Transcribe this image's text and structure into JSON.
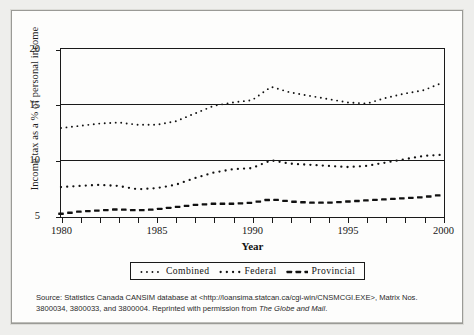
{
  "chart_data": {
    "type": "line",
    "title": "",
    "xlabel": "Year",
    "ylabel": "Income tax as a % of personal income",
    "xlim": [
      1980,
      2000
    ],
    "ylim": [
      5,
      20
    ],
    "yticks": [
      5,
      10,
      15,
      20
    ],
    "xticks": [
      1980,
      1981,
      1982,
      1983,
      1984,
      1985,
      1986,
      1987,
      1988,
      1989,
      1990,
      1991,
      1992,
      1993,
      1994,
      1995,
      1996,
      1997,
      1998,
      1999,
      2000
    ],
    "xtick_labels_shown": [
      1980,
      1985,
      1990,
      1995,
      2000
    ],
    "grid": "horizontal-gridlines-at-10-and-15",
    "legend_position": "below-axes-center",
    "x": [
      1980,
      1981,
      1982,
      1983,
      1984,
      1985,
      1986,
      1987,
      1988,
      1989,
      1990,
      1991,
      1992,
      1993,
      1994,
      1995,
      1996,
      1997,
      1998,
      1999,
      2000
    ],
    "series": [
      {
        "name": "Combined",
        "marker": "fine-dotted",
        "color": "#111111",
        "values": [
          12.9,
          13.1,
          13.3,
          13.4,
          13.2,
          13.2,
          13.5,
          14.2,
          14.9,
          15.2,
          15.4,
          16.6,
          16.1,
          15.8,
          15.5,
          15.2,
          15.1,
          15.6,
          16.0,
          16.3,
          17.0
        ]
      },
      {
        "name": "Federal",
        "marker": "medium-dotted",
        "color": "#111111",
        "values": [
          7.6,
          7.7,
          7.8,
          7.7,
          7.4,
          7.5,
          7.8,
          8.4,
          8.9,
          9.2,
          9.3,
          10.0,
          9.7,
          9.6,
          9.5,
          9.4,
          9.5,
          9.8,
          10.1,
          10.4,
          10.5
        ]
      },
      {
        "name": "Provincial",
        "marker": "dashed",
        "color": "#111111",
        "values": [
          5.2,
          5.4,
          5.5,
          5.6,
          5.5,
          5.6,
          5.8,
          6.0,
          6.1,
          6.1,
          6.2,
          6.5,
          6.3,
          6.2,
          6.2,
          6.3,
          6.4,
          6.5,
          6.6,
          6.7,
          6.9
        ]
      }
    ]
  },
  "axis": {
    "ylabel": "Income tax as a % of personal income",
    "xlabel": "Year",
    "ytick_labels": [
      "20",
      "15",
      "10",
      "5"
    ],
    "xtick_labels": [
      "1980",
      "1985",
      "1990",
      "1995",
      "2000"
    ]
  },
  "legend": {
    "entries": [
      {
        "label": "Combined",
        "style": "fine-dotted"
      },
      {
        "label": "Federal",
        "style": "medium-dotted"
      },
      {
        "label": "Provincial",
        "style": "dashed"
      }
    ]
  },
  "source": {
    "line1_a": "Source: Statistics Canada CANSIM database at <http://loansima.statcan.ca/cgi-win/CNSMCGI.EXE>, Matrix Nos.",
    "line2_a": "3800034, 3800033, and 3800004. Reprinted with permission from ",
    "line2_italic": "The Globe and Mail",
    "line2_b": "."
  }
}
